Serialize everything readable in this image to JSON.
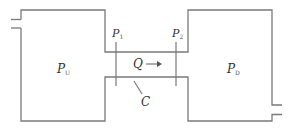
{
  "diagram": {
    "labels": {
      "upstream_pressure": {
        "main": "P",
        "sub": "U"
      },
      "downstream_pressure": {
        "main": "P",
        "sub": "D"
      },
      "tap1": {
        "main": "P",
        "sub": "1"
      },
      "tap2": {
        "main": "P",
        "sub": "2"
      },
      "flow": "Q",
      "conductance": "C"
    },
    "colors": {
      "line": "#7a7a7a",
      "text": "#333333",
      "background": "#ffffff"
    }
  }
}
